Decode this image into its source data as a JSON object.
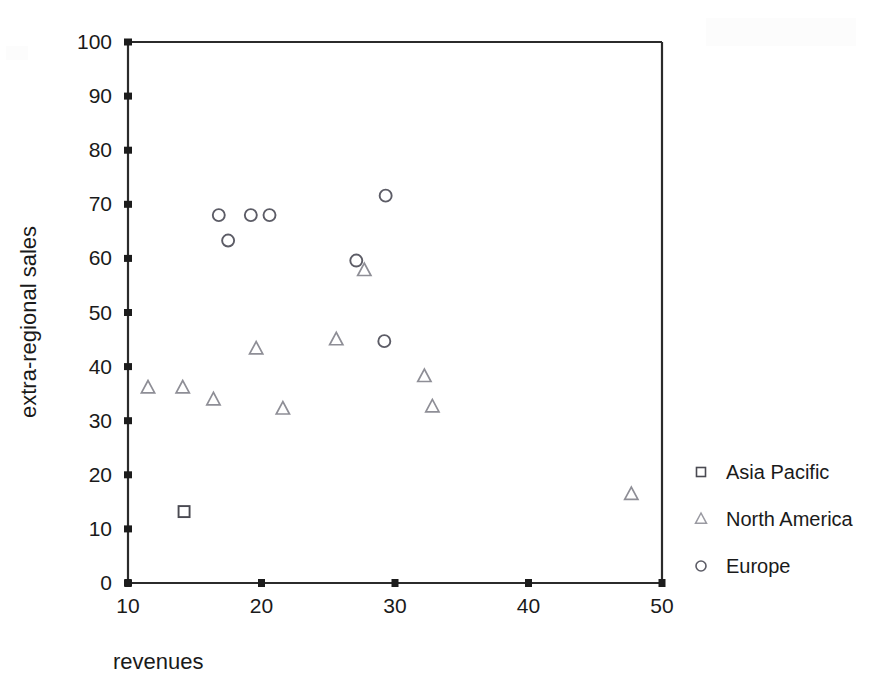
{
  "chart_data": {
    "type": "scatter",
    "title": "",
    "xlabel": "revenues",
    "ylabel": "extra-regional sales",
    "xlim": [
      10,
      50
    ],
    "ylim": [
      0,
      100
    ],
    "xticks": [
      10,
      20,
      30,
      40,
      50
    ],
    "yticks": [
      0,
      10,
      20,
      30,
      40,
      50,
      60,
      70,
      80,
      90,
      100
    ],
    "grid": false,
    "legend_position": "right",
    "series": [
      {
        "name": "Asia Pacific",
        "marker": "square",
        "color": "#4a4a52",
        "points": [
          {
            "x": 14.2,
            "y": 13.2
          }
        ]
      },
      {
        "name": "North America",
        "marker": "triangle",
        "color": "#8e8e96",
        "points": [
          {
            "x": 11.5,
            "y": 36.1
          },
          {
            "x": 14.1,
            "y": 36.1
          },
          {
            "x": 16.4,
            "y": 33.9
          },
          {
            "x": 19.6,
            "y": 43.3
          },
          {
            "x": 21.6,
            "y": 32.2
          },
          {
            "x": 25.6,
            "y": 45.0
          },
          {
            "x": 27.7,
            "y": 57.8
          },
          {
            "x": 32.2,
            "y": 38.2
          },
          {
            "x": 32.8,
            "y": 32.6
          },
          {
            "x": 47.7,
            "y": 16.4
          }
        ]
      },
      {
        "name": "Europe",
        "marker": "circle",
        "color": "#5c5c66",
        "points": [
          {
            "x": 16.8,
            "y": 68.0
          },
          {
            "x": 17.5,
            "y": 63.3
          },
          {
            "x": 19.2,
            "y": 68.0
          },
          {
            "x": 20.6,
            "y": 68.0
          },
          {
            "x": 27.1,
            "y": 59.6
          },
          {
            "x": 29.3,
            "y": 71.6
          },
          {
            "x": 29.2,
            "y": 44.7
          }
        ]
      }
    ]
  },
  "axes": {
    "x_title": "revenues",
    "y_title": "extra-regional sales",
    "x_tick_labels": [
      "10",
      "20",
      "30",
      "40",
      "50"
    ],
    "y_tick_labels": [
      "0",
      "10",
      "20",
      "30",
      "40",
      "50",
      "60",
      "70",
      "80",
      "90",
      "100"
    ]
  },
  "legend": {
    "entries": [
      {
        "label": "Asia Pacific",
        "marker_icon": "square-marker-icon"
      },
      {
        "label": "North America",
        "marker_icon": "triangle-marker-icon"
      },
      {
        "label": "Europe",
        "marker_icon": "circle-marker-icon"
      }
    ]
  },
  "colors": {
    "axis": "#2b2b2b",
    "text": "#1a1a1a",
    "asia_pacific": "#4a4a52",
    "north_america": "#8e8e96",
    "europe": "#5c5c66",
    "background": "#ffffff"
  }
}
